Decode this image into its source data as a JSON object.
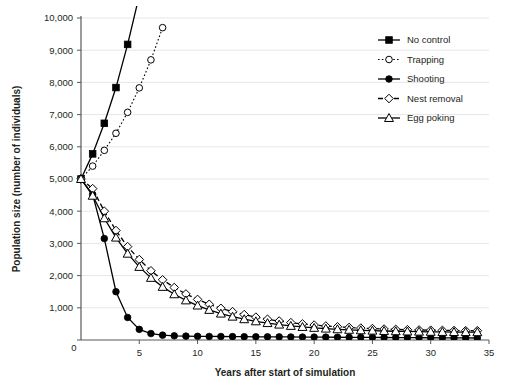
{
  "chart_data": {
    "type": "line",
    "title": "",
    "xlabel": "Years after start of simulation",
    "ylabel": "Population size (number of individuals)",
    "xlim": [
      0,
      35
    ],
    "ylim": [
      0,
      10000
    ],
    "xticks": [
      "0",
      "5",
      "10",
      "15",
      "20",
      "25",
      "30",
      "35"
    ],
    "xtick_values": [
      0,
      5,
      10,
      15,
      20,
      25,
      30,
      35
    ],
    "yticks": [
      "0",
      "1,000",
      "2,000",
      "3,000",
      "4,000",
      "5,000",
      "6,000",
      "7,000",
      "8,000",
      "9,000",
      "10,000"
    ],
    "ytick_values": [
      0,
      1000,
      2000,
      3000,
      4000,
      5000,
      6000,
      7000,
      8000,
      9000,
      10000
    ],
    "grid": "horizontal",
    "grid_color": "#e6e6e6",
    "axis_color": "#58595b",
    "legend_position": "top-right",
    "series": [
      {
        "name": "No control",
        "marker": "filled-square",
        "line": "solid",
        "color": "#000000",
        "x": [
          0,
          1,
          2,
          3,
          4,
          5
        ],
        "values": [
          5000,
          5780,
          6730,
          7840,
          9180,
          10700
        ]
      },
      {
        "name": "Trapping",
        "marker": "open-circle",
        "line": "dotted",
        "color": "#000000",
        "x": [
          0,
          1,
          2,
          3,
          4,
          5,
          6,
          7
        ],
        "values": [
          5000,
          5400,
          5890,
          6420,
          7070,
          7830,
          8700,
          9700
        ]
      },
      {
        "name": "Shooting",
        "marker": "filled-circle",
        "line": "solid",
        "color": "#000000",
        "x": [
          0,
          1,
          2,
          3,
          4,
          5,
          6,
          7,
          8,
          9,
          10,
          11,
          12,
          13,
          14,
          15,
          16,
          17,
          18,
          19,
          20,
          21,
          22,
          23,
          24,
          25,
          26,
          27,
          28,
          29,
          30,
          31,
          32,
          33,
          34
        ],
        "values": [
          5000,
          4520,
          3150,
          1500,
          700,
          330,
          200,
          150,
          130,
          120,
          115,
          110,
          108,
          105,
          103,
          100,
          98,
          96,
          94,
          92,
          90,
          88,
          86,
          84,
          82,
          80,
          78,
          76,
          74,
          72,
          70,
          68,
          66,
          64,
          62
        ]
      },
      {
        "name": "Nest removal",
        "marker": "open-diamond",
        "line": "dashed",
        "color": "#000000",
        "x": [
          0,
          1,
          2,
          3,
          4,
          5,
          6,
          7,
          8,
          9,
          10,
          11,
          12,
          13,
          14,
          15,
          16,
          17,
          18,
          19,
          20,
          21,
          22,
          23,
          24,
          25,
          26,
          27,
          28,
          29,
          30,
          31,
          32,
          33,
          34
        ],
        "values": [
          5000,
          4700,
          4000,
          3400,
          2900,
          2500,
          2150,
          1870,
          1630,
          1430,
          1260,
          1110,
          985,
          880,
          790,
          710,
          645,
          590,
          540,
          500,
          465,
          435,
          410,
          390,
          370,
          355,
          340,
          330,
          320,
          312,
          305,
          300,
          295,
          290,
          288
        ]
      },
      {
        "name": "Egg poking",
        "marker": "open-triangle",
        "line": "solid",
        "color": "#000000",
        "x": [
          0,
          1,
          2,
          3,
          4,
          5,
          6,
          7,
          8,
          9,
          10,
          11,
          12,
          13,
          14,
          15,
          16,
          17,
          18,
          19,
          20,
          21,
          22,
          23,
          24,
          25,
          26,
          27,
          28,
          29,
          30,
          31,
          32,
          33,
          34
        ],
        "values": [
          5000,
          4480,
          3780,
          3180,
          2680,
          2270,
          1930,
          1650,
          1420,
          1230,
          1070,
          935,
          820,
          725,
          645,
          580,
          525,
          478,
          438,
          405,
          377,
          353,
          333,
          316,
          302,
          290,
          280,
          272,
          265,
          259,
          254,
          250,
          247,
          244,
          242
        ]
      }
    ]
  }
}
